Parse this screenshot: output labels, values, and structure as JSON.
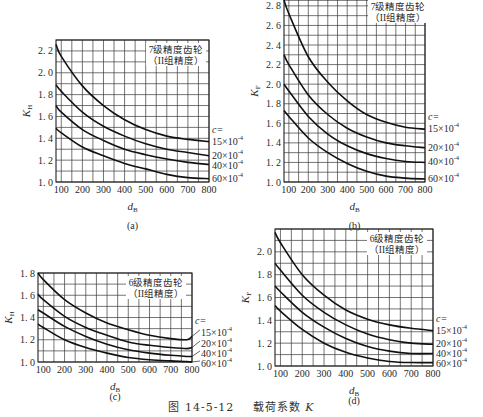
{
  "figure": {
    "number": "图 14-5-12",
    "title": "载荷系数",
    "symbol": "K"
  },
  "chart_data": [
    {
      "id": "a",
      "type": "line",
      "panel_label": "(a)",
      "title": "7级精度齿轮",
      "subtitle": "（II组精度）",
      "xlabel": "d_B",
      "ylabel": "K_H",
      "xlim": [
        75,
        800
      ],
      "ylim": [
        1.0,
        2.3
      ],
      "xticks": [
        100,
        200,
        300,
        400,
        500,
        600,
        700,
        800
      ],
      "yticks": [
        1.0,
        1.2,
        1.4,
        1.6,
        1.8,
        2.0,
        2.2
      ],
      "grid": true,
      "legend_title": "c=",
      "x": [
        75,
        100,
        200,
        300,
        400,
        500,
        600,
        700,
        800
      ],
      "series": [
        {
          "name": "15×10⁻⁴",
          "values": [
            2.26,
            2.15,
            1.88,
            1.7,
            1.57,
            1.48,
            1.42,
            1.39,
            1.37
          ]
        },
        {
          "name": "20×10⁻⁴",
          "values": [
            1.89,
            1.83,
            1.64,
            1.51,
            1.42,
            1.35,
            1.3,
            1.27,
            1.24
          ]
        },
        {
          "name": "40×10⁻⁴",
          "values": [
            1.7,
            1.64,
            1.48,
            1.38,
            1.3,
            1.25,
            1.21,
            1.18,
            1.16
          ]
        },
        {
          "name": "60×10⁻⁴",
          "values": [
            1.49,
            1.45,
            1.32,
            1.24,
            1.17,
            1.12,
            1.07,
            1.04,
            1.03
          ]
        }
      ],
      "frame": {
        "left": 56,
        "top": 40,
        "right": 209,
        "bottom": 182
      }
    },
    {
      "id": "b",
      "type": "line",
      "panel_label": "(b)",
      "title": "7级精度齿轮",
      "subtitle": "（II组精度）",
      "xlabel": "d_B",
      "ylabel": "K_F",
      "xlim": [
        75,
        800
      ],
      "ylim": [
        1.0,
        2.86
      ],
      "xticks": [
        100,
        200,
        300,
        400,
        500,
        600,
        700,
        800
      ],
      "yticks": [
        1.0,
        1.2,
        1.4,
        1.6,
        1.8,
        2.0,
        2.2,
        2.4,
        2.6,
        2.8
      ],
      "grid": true,
      "legend_title": "c=",
      "x": [
        75,
        100,
        200,
        300,
        400,
        500,
        600,
        700,
        800
      ],
      "series": [
        {
          "name": "15×10⁻⁴",
          "values": [
            2.86,
            2.72,
            2.28,
            2.02,
            1.83,
            1.69,
            1.61,
            1.56,
            1.54
          ]
        },
        {
          "name": "20×10⁻⁴",
          "values": [
            2.3,
            2.2,
            1.89,
            1.69,
            1.55,
            1.46,
            1.4,
            1.37,
            1.35
          ]
        },
        {
          "name": "40×10⁻⁴",
          "values": [
            2.0,
            1.93,
            1.67,
            1.49,
            1.37,
            1.29,
            1.24,
            1.21,
            1.2
          ]
        },
        {
          "name": "60×10⁻⁴",
          "values": [
            1.73,
            1.67,
            1.45,
            1.3,
            1.19,
            1.11,
            1.06,
            1.04,
            1.03
          ]
        }
      ],
      "frame": {
        "left": 284,
        "top": 0,
        "right": 425,
        "bottom": 182
      }
    },
    {
      "id": "c",
      "type": "line",
      "panel_label": "(c)",
      "title": "6级精度齿轮",
      "subtitle": "（II组精度）",
      "xlabel": "d_B",
      "ylabel": "K_H",
      "xlim": [
        75,
        800
      ],
      "ylim": [
        1.0,
        1.8
      ],
      "xticks": [
        100,
        200,
        300,
        400,
        500,
        600,
        700,
        800
      ],
      "yticks": [
        1.0,
        1.2,
        1.4,
        1.6,
        1.8
      ],
      "grid": true,
      "legend_title": "c=",
      "x": [
        75,
        100,
        200,
        300,
        400,
        500,
        600,
        700,
        775,
        800
      ],
      "series": [
        {
          "name": "15×10⁻⁴",
          "values": [
            1.8,
            1.74,
            1.56,
            1.44,
            1.35,
            1.29,
            1.24,
            1.21,
            1.2,
            1.23
          ]
        },
        {
          "name": "20×10⁻⁴",
          "values": [
            1.61,
            1.56,
            1.41,
            1.31,
            1.24,
            1.18,
            1.15,
            1.13,
            1.12,
            1.13
          ]
        },
        {
          "name": "40×10⁻⁴",
          "values": [
            1.47,
            1.44,
            1.32,
            1.23,
            1.16,
            1.11,
            1.08,
            1.06,
            1.05,
            1.05
          ]
        },
        {
          "name": "60×10⁻⁴",
          "values": [
            1.34,
            1.31,
            1.2,
            1.13,
            1.08,
            1.04,
            1.02,
            1.01,
            1.005,
            1.0
          ]
        }
      ],
      "frame": {
        "left": 38,
        "top": 273,
        "right": 192,
        "bottom": 362
      }
    },
    {
      "id": "d",
      "type": "line",
      "panel_label": "(d)",
      "title": "6级精度齿轮",
      "subtitle": "（II组精度）",
      "xlabel": "d_B",
      "ylabel": "K_F",
      "xlim": [
        75,
        800
      ],
      "ylim": [
        1.0,
        2.2
      ],
      "xticks": [
        100,
        200,
        300,
        400,
        500,
        600,
        700,
        800
      ],
      "yticks": [
        1.0,
        1.2,
        1.4,
        1.6,
        1.8,
        2.0
      ],
      "grid": true,
      "legend_title": "c=",
      "x": [
        75,
        100,
        200,
        300,
        400,
        500,
        600,
        700,
        800
      ],
      "series": [
        {
          "name": "15×10⁻⁴",
          "values": [
            2.17,
            2.08,
            1.8,
            1.62,
            1.49,
            1.41,
            1.36,
            1.33,
            1.31
          ]
        },
        {
          "name": "20×10⁻⁴",
          "values": [
            1.9,
            1.84,
            1.62,
            1.47,
            1.36,
            1.28,
            1.23,
            1.2,
            1.19
          ]
        },
        {
          "name": "40×10⁻⁴",
          "values": [
            1.7,
            1.65,
            1.47,
            1.34,
            1.24,
            1.17,
            1.13,
            1.11,
            1.11
          ]
        },
        {
          "name": "60×10⁻⁴",
          "values": [
            1.53,
            1.48,
            1.32,
            1.2,
            1.12,
            1.07,
            1.04,
            1.03,
            1.03
          ]
        }
      ],
      "frame": {
        "left": 275,
        "top": 229,
        "right": 433,
        "bottom": 366
      }
    }
  ]
}
